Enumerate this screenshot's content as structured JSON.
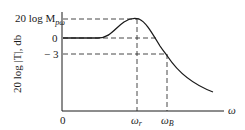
{
  "diagram": {
    "y_axis_label": "20 log |T|, db",
    "x_axis_label": "ω",
    "origin_label": "0",
    "y_ticks": [
      {
        "label_main": "20 log M",
        "label_sub": "pω",
        "level": "peak"
      },
      {
        "label_main": "0",
        "level": "zero"
      },
      {
        "label_main": "− 3",
        "level": "minus3"
      }
    ],
    "x_ticks": [
      {
        "label_main": "ω",
        "label_sub": "r",
        "meaning": "resonant frequency"
      },
      {
        "label_main": "ω",
        "label_sub": "B",
        "meaning": "bandwidth"
      }
    ],
    "curve_description": "Flat at 0 db, rises to resonant peak at ω_r, falls through −3 db at ω_B, continues decreasing",
    "colors": {
      "line": "#1a1a1a",
      "background": "#ffffff"
    }
  }
}
